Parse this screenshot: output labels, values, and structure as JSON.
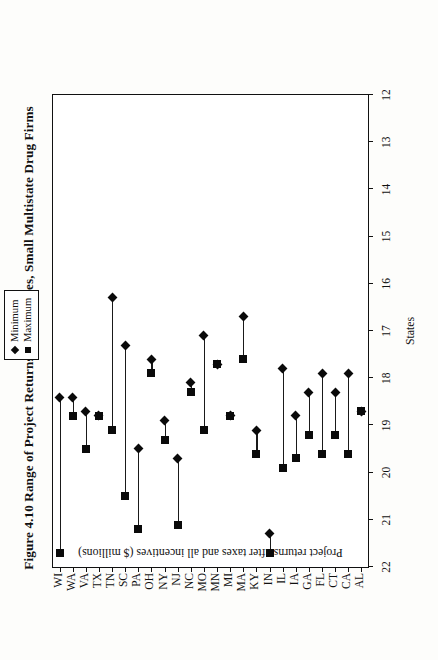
{
  "figure": {
    "title": "Figure 4.10  Range of Project Returns within States, Small Multistate Drug Firms"
  },
  "legend": {
    "position": "top-center",
    "entries": [
      {
        "label": "Minimum",
        "marker": "diamond-marker-icon"
      },
      {
        "label": "Maximum",
        "marker": "square-marker-icon"
      }
    ]
  },
  "chart_data": {
    "type": "bar",
    "subtype": "range-plot",
    "title": "Figure 4.10  Range of Project Returns within States, Small Multistate Drug Firms",
    "xlabel": "States",
    "ylabel": "Project returns after taxes and all incentives ($ millions)",
    "ylim": [
      12,
      22
    ],
    "yticks": [
      22,
      21,
      20,
      19,
      18,
      17,
      16,
      15,
      14,
      13,
      12
    ],
    "y_axis_inverted": true,
    "grid": false,
    "categories": [
      "AL",
      "CA",
      "CT",
      "FL",
      "GA",
      "IA",
      "IL",
      "IN",
      "KY",
      "MA",
      "MI",
      "MN",
      "MO",
      "NC",
      "NJ",
      "NY",
      "OH",
      "PA",
      "SC",
      "TN",
      "TX",
      "VA",
      "WA",
      "WI"
    ],
    "series": [
      {
        "name": "Minimum",
        "marker": "diamond",
        "values": [
          18.7,
          17.9,
          18.3,
          17.9,
          18.3,
          18.8,
          17.8,
          21.3,
          19.1,
          16.7,
          18.8,
          17.7,
          17.1,
          18.1,
          19.7,
          18.9,
          17.6,
          19.5,
          17.3,
          16.3,
          18.8,
          18.7,
          18.4,
          18.4
        ]
      },
      {
        "name": "Maximum",
        "marker": "square",
        "values": [
          18.7,
          19.6,
          19.2,
          19.6,
          19.2,
          19.7,
          19.9,
          21.7,
          19.6,
          17.6,
          18.8,
          17.7,
          19.1,
          18.3,
          21.1,
          19.3,
          17.9,
          21.2,
          20.5,
          19.1,
          18.8,
          19.5,
          18.8,
          21.7
        ]
      }
    ]
  }
}
